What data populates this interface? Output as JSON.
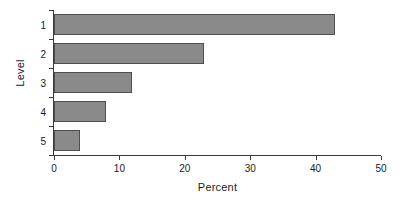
{
  "chart_data": {
    "type": "bar",
    "orientation": "horizontal",
    "title": "",
    "xlabel": "Percent",
    "ylabel": "Level",
    "categories": [
      "1",
      "2",
      "3",
      "4",
      "5"
    ],
    "values": [
      43,
      23,
      12,
      8,
      4
    ],
    "xlim": [
      0,
      50
    ],
    "xticks": [
      0,
      10,
      20,
      30,
      40,
      50
    ],
    "xtick_labels": [
      "0",
      "10",
      "20",
      "30",
      "40",
      "50"
    ],
    "ytick_labels": [
      "1",
      "2",
      "3",
      "4",
      "5"
    ],
    "grid": false,
    "legend": false,
    "bar_color": "#8a8a8a",
    "bar_edge_color": "#4f4f4f",
    "axis_color": "#3a3a3a",
    "background": "#ffffff"
  }
}
